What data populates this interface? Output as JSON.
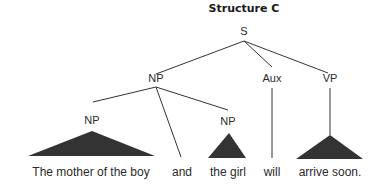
{
  "title": "Structure C",
  "nodes": {
    "s": "S",
    "np_main": "NP",
    "aux": "Aux",
    "vp": "VP",
    "np_left": "NP",
    "np_right": "NP"
  },
  "words": {
    "w1": "The mother of the boy",
    "w2": "and",
    "w3": "the girl",
    "w4": "will",
    "w5": "arrive soon."
  },
  "colors": {
    "ink": "#333333",
    "background": "#ffffff"
  }
}
